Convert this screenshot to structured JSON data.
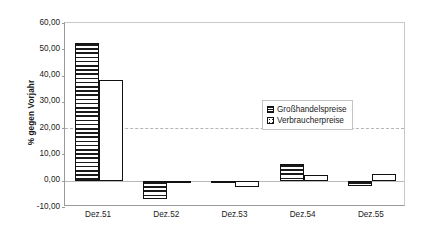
{
  "chart_data": {
    "type": "bar",
    "title": "",
    "subtitle": "",
    "xlabel": "",
    "ylabel": "% gegen Vorjahr",
    "categories": [
      "Dez.51",
      "Dez.52",
      "Dez.53",
      "Dez.54",
      "Dez.55"
    ],
    "series": [
      {
        "name": "Großhandelspreise",
        "pattern": "horizontal-stripes",
        "values": [
          52.5,
          -7.0,
          -0.5,
          6.5,
          -2.0
        ]
      },
      {
        "name": "Verbraucherpreise",
        "pattern": "dots",
        "values": [
          38.5,
          -0.5,
          -2.5,
          2.0,
          2.5
        ]
      }
    ],
    "ylim": [
      -10,
      60
    ],
    "ytick_values": [
      60,
      50,
      40,
      30,
      20,
      10,
      0,
      -10
    ],
    "ytick_labels": [
      "60,00",
      "50,00",
      "40,00",
      "30,00",
      "20,00",
      "10,00",
      "0,00",
      "-10,00"
    ],
    "gridlines": [
      20
    ],
    "zero_line": 0,
    "grid": true,
    "legend_position": "center-right",
    "colors": {
      "bar_outline": "#111111",
      "bar_fill": "#ffffff",
      "gridline": "#b4b4b4",
      "axis": "#9a9a9a",
      "text": "#1a1a1a"
    }
  }
}
